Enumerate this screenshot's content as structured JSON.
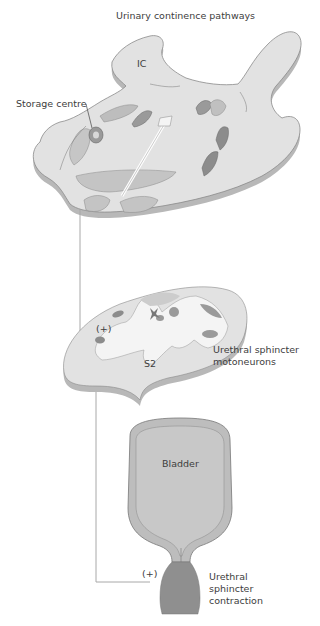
{
  "title": "Urinary continence pathways",
  "labels": {
    "ic": "IC",
    "storage_centre": "Storage centre",
    "s2": "S2",
    "spinal_plus": "(+)",
    "motoneurons_line1": "Urethral sphincter",
    "motoneurons_line2": "motoneurons",
    "bladder": "Bladder",
    "sphincter_plus": "(+)",
    "contraction_line1": "Urethral",
    "contraction_line2": "sphincter",
    "contraction_line3": "contraction"
  },
  "colors": {
    "tissue_light": "#e2e2e2",
    "tissue_edge": "#b8b8b8",
    "nucleus_mid": "#b0b0b0",
    "nucleus_dark": "#8c8c8c",
    "grey_matter": "#f4f4f4",
    "bladder_fill": "#bdbdbd",
    "bladder_inner": "#c8c8c8",
    "sphincter_fill": "#8f8f8f",
    "pathway_line": "#a8a8a8",
    "text": "#3d3d3d"
  }
}
